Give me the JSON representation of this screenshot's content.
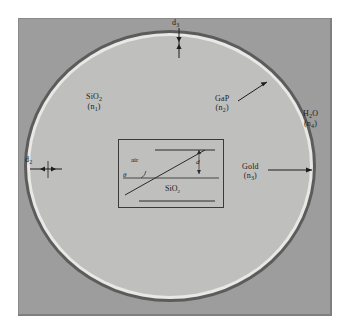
{
  "figure": {
    "type": "cross-section-schematic",
    "title": "",
    "background_color": "#ffffff",
    "panel_color": "#9d9d9d"
  },
  "layers": [
    {
      "key": "core",
      "material": "SiO2",
      "index_symbol": "n1",
      "color": "#bfbfbd"
    },
    {
      "key": "gap",
      "material": "GaP",
      "index_symbol": "n2",
      "color": "#e8e8e4"
    },
    {
      "key": "gold",
      "material": "Gold",
      "index_symbol": "n3",
      "color": "#5c5c5c"
    },
    {
      "key": "medium",
      "material": "H2O",
      "index_symbol": "n4",
      "color": "#9d9d9d"
    }
  ],
  "labels": {
    "sio2": {
      "material": "SiO",
      "material_sub": "2",
      "index": "(n",
      "index_sub": "1",
      "index_close": ")"
    },
    "gap": {
      "material": "GaP",
      "material_sub": "",
      "index": "(n",
      "index_sub": "2",
      "index_close": ")"
    },
    "gold": {
      "material": "Gold",
      "material_sub": "",
      "index": "(n",
      "index_sub": "3",
      "index_close": ")"
    },
    "h2o": {
      "material": "H",
      "material_sub": "2",
      "material_tail": "O",
      "index": "(n",
      "index_sub": "4",
      "index_close": ")"
    }
  },
  "dimensions": [
    {
      "name": "d3",
      "symbol": "d",
      "sub": "3",
      "position": "top",
      "describes": "gold layer thickness"
    },
    {
      "name": "d2",
      "symbol": "d",
      "sub": "2",
      "position": "left",
      "describes": "GaP layer thickness"
    }
  ],
  "inset": {
    "top_medium": "air",
    "bottom_medium": "SiO",
    "bottom_medium_sub": "2",
    "angle_symbol": "θ",
    "thickness_symbol": "d",
    "border_color": "#3a3a3a",
    "fill_color": "#bfbfbd"
  },
  "colors": {
    "ink": "#1c1c1c",
    "line": "#2a2a2a",
    "panel_border": "#8a8a8a"
  }
}
